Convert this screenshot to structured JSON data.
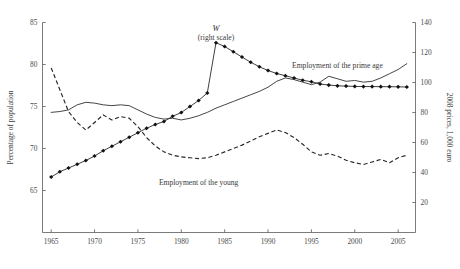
{
  "chart_data": {
    "type": "line",
    "title": "",
    "subtitle": "",
    "xlabel": "",
    "ylabel": "Percentage of population",
    "y2label": "2008 prices, 1,000 euro",
    "xlim": [
      1964,
      2007
    ],
    "ylim": [
      60,
      85
    ],
    "y2lim": [
      0,
      140
    ],
    "grid": false,
    "legend_position": "inline-annotations",
    "xticks": [
      1965,
      1970,
      1975,
      1980,
      1985,
      1990,
      1995,
      2000,
      2005
    ],
    "xtick_labels": [
      "1965",
      "1970",
      "1975",
      "1980",
      "1985",
      "1990",
      "1995",
      "2000",
      "2005"
    ],
    "yticks": [
      65,
      70,
      75,
      80,
      85
    ],
    "ytick_labels": [
      "65",
      "70",
      "75",
      "80",
      "85"
    ],
    "y2ticks": [
      20,
      40,
      60,
      80,
      100,
      120,
      140
    ],
    "y2tick_labels": [
      "20",
      "40",
      "60",
      "80",
      "100",
      "120",
      "140"
    ],
    "annotations": [
      {
        "text": "W",
        "sub": "(right scale)",
        "x": 1984.0,
        "y": 84.0,
        "style": "italic"
      },
      {
        "text": "Employment of the prime age",
        "x": 1998.0,
        "y": 79.6,
        "style": "plain"
      },
      {
        "text": "Employment of the young",
        "x": 1982.0,
        "y": 65.6,
        "style": "plain"
      }
    ],
    "series": [
      {
        "name": "W",
        "axis": "right",
        "style": "line-with-markers",
        "marker": "filled-diamond",
        "x": [
          1965,
          1966,
          1967,
          1968,
          1969,
          1970,
          1971,
          1972,
          1973,
          1974,
          1975,
          1976,
          1977,
          1978,
          1979,
          1980,
          1981,
          1982,
          1983,
          1984,
          1985,
          1986,
          1987,
          1988,
          1989,
          1990,
          1991,
          1992,
          1993,
          1994,
          1995,
          1996,
          1997,
          1998,
          1999,
          2000,
          2001,
          2002,
          2003,
          2004,
          2005,
          2006
        ],
        "values": [
          37.0,
          40.5,
          43.0,
          45.5,
          48.0,
          51.0,
          54.5,
          57.5,
          60.5,
          63.5,
          66.5,
          69.5,
          72.0,
          74.0,
          77.5,
          80.0,
          84.0,
          88.0,
          93.0,
          126.5,
          124.0,
          120.5,
          117.0,
          113.5,
          110.5,
          108.0,
          106.0,
          104.5,
          103.0,
          101.5,
          100.5,
          99.0,
          98.3,
          97.8,
          97.6,
          97.4,
          97.3,
          97.3,
          97.2,
          97.2,
          97.1,
          97.0
        ]
      },
      {
        "name": "Employment of the prime age",
        "axis": "left",
        "style": "solid-line",
        "x": [
          1965,
          1966,
          1967,
          1968,
          1969,
          1970,
          1971,
          1972,
          1973,
          1974,
          1975,
          1976,
          1977,
          1978,
          1979,
          1980,
          1981,
          1982,
          1983,
          1984,
          1985,
          1986,
          1987,
          1988,
          1989,
          1990,
          1991,
          1992,
          1993,
          1994,
          1995,
          1996,
          1997,
          1998,
          1999,
          2000,
          2001,
          2002,
          2003,
          2004,
          2005,
          2006
        ],
        "values": [
          74.3,
          74.4,
          74.6,
          75.2,
          75.5,
          75.4,
          75.2,
          75.1,
          75.2,
          75.1,
          74.6,
          74.1,
          73.7,
          73.5,
          73.6,
          73.4,
          73.6,
          73.9,
          74.3,
          74.8,
          75.2,
          75.6,
          76.0,
          76.4,
          76.8,
          77.3,
          78.0,
          78.4,
          78.2,
          77.9,
          77.6,
          77.9,
          78.6,
          78.3,
          78.0,
          78.1,
          77.9,
          78.0,
          78.4,
          78.9,
          79.4,
          80.1
        ]
      },
      {
        "name": "Employment of the young",
        "axis": "left",
        "style": "dashed-line",
        "x": [
          1965,
          1966,
          1967,
          1968,
          1969,
          1970,
          1971,
          1972,
          1973,
          1974,
          1975,
          1976,
          1977,
          1978,
          1979,
          1980,
          1981,
          1982,
          1983,
          1984,
          1985,
          1986,
          1987,
          1988,
          1989,
          1990,
          1991,
          1992,
          1993,
          1994,
          1995,
          1996,
          1997,
          1998,
          1999,
          2000,
          2001,
          2002,
          2003,
          2004,
          2005,
          2006
        ],
        "values": [
          79.6,
          77.0,
          74.4,
          73.1,
          72.2,
          73.1,
          74.0,
          73.4,
          73.8,
          73.6,
          72.6,
          71.3,
          70.3,
          69.6,
          69.2,
          69.0,
          68.9,
          68.8,
          68.9,
          69.2,
          69.6,
          70.0,
          70.4,
          70.9,
          71.4,
          71.8,
          72.2,
          71.9,
          71.3,
          70.5,
          69.6,
          69.2,
          69.4,
          69.1,
          68.6,
          68.3,
          68.1,
          68.4,
          68.7,
          68.3,
          68.9,
          69.2
        ]
      }
    ]
  }
}
